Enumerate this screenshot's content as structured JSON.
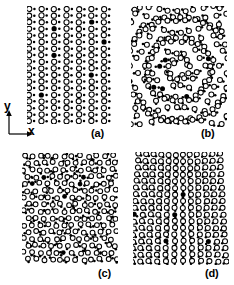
{
  "figure": {
    "type": "scientific-figure",
    "background_color": "#ffffff",
    "ink_color": "#000000",
    "width": 234,
    "height": 285
  },
  "axis_key": {
    "name": "xy-axis-indicator",
    "x_label": "x",
    "y_label": "y",
    "arrow_color": "#000000"
  },
  "panels": [
    {
      "id": "a",
      "label": "(a)",
      "name": "panel-a",
      "lattice": "ordered-rectangular",
      "rows": 18,
      "cols": 7,
      "open_radius": 2.6,
      "filled_radius": 1.25,
      "pair_offset_x": 5.2,
      "pair_offset_y": 0.0,
      "spacing_x": 12.5,
      "spacing_y": 6.6,
      "stagger_x": 0.0,
      "distortion": "none"
    },
    {
      "id": "b",
      "label": "(b)",
      "name": "panel-b",
      "lattice": "radially-distorted",
      "rows": 17,
      "cols": 11,
      "open_radius": 2.5,
      "filled_radius": 1.3,
      "pair_offset_x": 3.2,
      "pair_offset_y": 1.6,
      "spacing_x": 8.7,
      "spacing_y": 7.1,
      "stagger_x": 4.35,
      "distortion": "circular-vortex",
      "distortion_amplitude": 3.4,
      "center_x": 0.5,
      "center_y": 0.52
    },
    {
      "id": "c",
      "label": "(c)",
      "name": "panel-c",
      "lattice": "disordered-rotated",
      "rows": 16,
      "cols": 12,
      "open_radius": 2.4,
      "filled_radius": 1.3,
      "pair_offset_x": 3.4,
      "pair_offset_y": 1.0,
      "spacing_x": 8.0,
      "spacing_y": 6.9,
      "stagger_x": 4.0,
      "distortion": "random-rotation",
      "distortion_amplitude": 1.5
    },
    {
      "id": "d",
      "label": "(d)",
      "name": "panel-d",
      "lattice": "column-bowed",
      "rows": 17,
      "cols": 12,
      "open_radius": 2.5,
      "filled_radius": 1.25,
      "pair_offset_x": 3.0,
      "pair_offset_y": 2.0,
      "spacing_x": 8.0,
      "spacing_y": 6.6,
      "stagger_x": 0.0,
      "distortion": "shear-bow",
      "distortion_amplitude": 5.0,
      "center_x": 0.5
    }
  ]
}
